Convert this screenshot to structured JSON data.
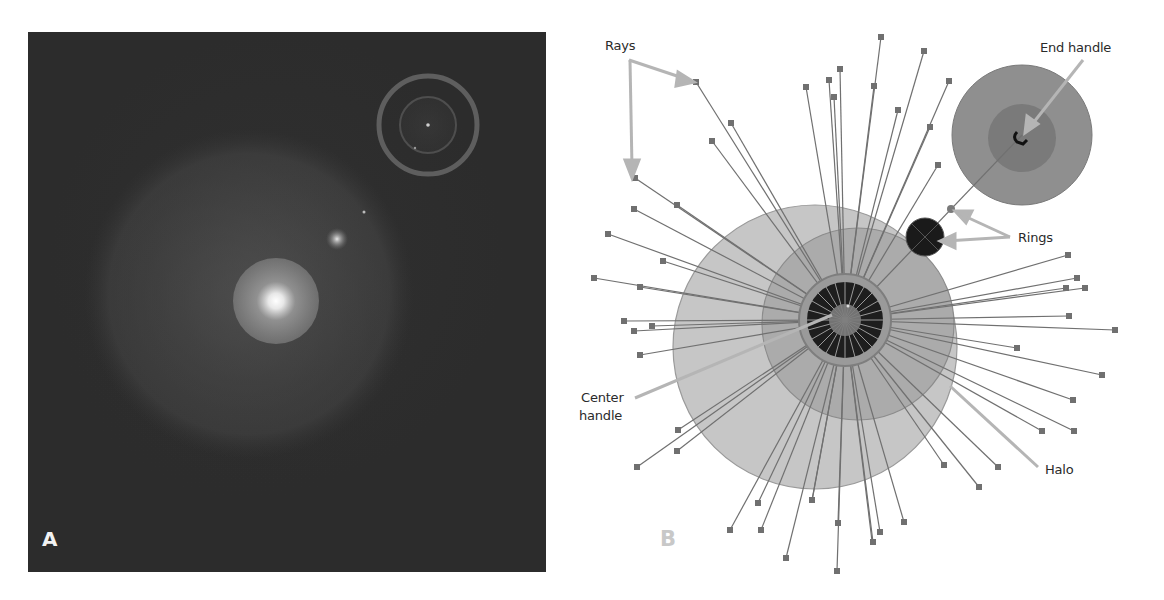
{
  "panels": {
    "a": {
      "letter": "A",
      "description": "Rendered lens flare on dark background",
      "colors": {
        "background": "#2c2c2c",
        "core": "#ffffff",
        "ring": "#5a5a5a"
      }
    },
    "b": {
      "letter": "B",
      "description": "Lens flare editing handles overlay",
      "colors": {
        "halo": "#c4c4c4",
        "inner_halo": "#a9a9a9",
        "ray": "#6e6e6e",
        "ray_handle": "#707070",
        "callout_arrow": "#b0b0b0",
        "rings": "#1a1a1a",
        "end_circle": "#8e8e8e"
      }
    }
  },
  "labels": {
    "rays": "Rays",
    "end_handle": "End handle",
    "rings": "Rings",
    "center_handle_line1": "Center",
    "center_handle_line2": "handle",
    "halo": "Halo"
  }
}
